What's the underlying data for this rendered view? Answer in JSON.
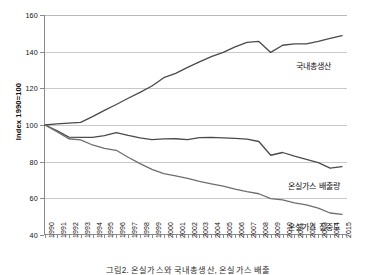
{
  "chart_data": {
    "type": "line",
    "title": "",
    "xlabel": "",
    "ylabel": "Index 1990=100",
    "ylim": [
      40,
      160
    ],
    "yticks": [
      40,
      60,
      80,
      100,
      120,
      140,
      160
    ],
    "grid": true,
    "legend_position": "inline-right",
    "x": [
      1990,
      1991,
      1992,
      1993,
      1994,
      1995,
      1996,
      1997,
      1998,
      1999,
      2000,
      2001,
      2002,
      2003,
      2004,
      2005,
      2006,
      2007,
      2008,
      2009,
      2010,
      2011,
      2012,
      2013,
      2014,
      2015
    ],
    "categories": [
      "1990",
      "1991",
      "1992",
      "1993",
      "1994",
      "1995",
      "1996",
      "1997",
      "1998",
      "1999",
      "2000",
      "2001",
      "2002",
      "2003",
      "2004",
      "2005",
      "2006",
      "2007",
      "2008",
      "2009",
      "2010",
      "2011",
      "2012",
      "2013",
      "2014",
      "2015"
    ],
    "series": [
      {
        "name": "국내총생산",
        "color": "#4a4a4a",
        "values": [
          100.0,
          100.6,
          101.0,
          101.4,
          104.6,
          108.0,
          111.2,
          114.6,
          117.8,
          121.3,
          125.8,
          128.2,
          131.4,
          134.4,
          137.3,
          139.6,
          142.6,
          145.1,
          145.6,
          139.6,
          143.5,
          144.3,
          144.2,
          145.6,
          147.2,
          148.8
        ]
      },
      {
        "name": "온실가스 배출량",
        "color": "#4a4a4a",
        "values": [
          100.0,
          97.0,
          93.4,
          93.3,
          93.2,
          94.2,
          95.9,
          94.3,
          93.0,
          92.0,
          92.4,
          92.5,
          92.0,
          93.1,
          93.2,
          93.0,
          92.7,
          92.3,
          91.0,
          83.5,
          85.0,
          83.0,
          81.3,
          79.5,
          76.5,
          77.3
        ]
      },
      {
        "name": "온실가스 집중도",
        "color": "#6e6e6e",
        "values": [
          100.0,
          96.4,
          92.5,
          91.9,
          89.1,
          87.3,
          86.2,
          82.4,
          78.9,
          75.8,
          73.5,
          72.2,
          70.9,
          69.3,
          67.9,
          66.6,
          65.0,
          63.6,
          62.5,
          59.8,
          59.2,
          57.5,
          56.4,
          54.7,
          52.0,
          51.2
        ]
      }
    ],
    "series_labels": [
      {
        "text": "국내총생산",
        "x_px": 296,
        "y_px": 60
      },
      {
        "text": "온실가스 배출량",
        "x_px": 288,
        "y_px": 180
      },
      {
        "text": "온실가스 집중도",
        "x_px": 288,
        "y_px": 221
      }
    ]
  },
  "caption": "그림2. 온실가스와 국내총생산, 온실가스 배출"
}
